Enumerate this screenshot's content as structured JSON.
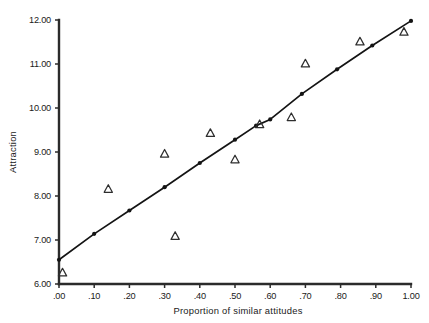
{
  "chart_data": {
    "type": "scatter",
    "title": "",
    "xlabel": "Proportion of similar attitudes",
    "ylabel": "Attraction",
    "xlim": [
      0.0,
      1.0
    ],
    "ylim": [
      6.0,
      12.0
    ],
    "grid": false,
    "legend": false,
    "xticks": [
      0.0,
      0.1,
      0.2,
      0.3,
      0.4,
      0.5,
      0.6,
      0.7,
      0.8,
      0.9,
      1.0
    ],
    "xticklabels": [
      ".00",
      ".10",
      ".20",
      ".30",
      ".40",
      ".50",
      ".60",
      ".70",
      ".80",
      ".90",
      "1.00"
    ],
    "yticks": [
      6.0,
      7.0,
      8.0,
      9.0,
      10.0,
      11.0,
      12.0
    ],
    "yticklabels": [
      "6.00",
      "7.00",
      "8.00",
      "9.00",
      "10.00",
      "11.00",
      "12.00"
    ],
    "series": [
      {
        "name": "predicted-line",
        "type": "line",
        "marker": "filled-circle",
        "x": [
          0.0,
          0.1,
          0.2,
          0.3,
          0.4,
          0.5,
          0.56,
          0.6,
          0.69,
          0.79,
          0.89,
          1.0
        ],
        "y": [
          6.55,
          7.14,
          7.67,
          8.2,
          8.75,
          9.28,
          9.6,
          9.74,
          10.32,
          10.88,
          11.42,
          11.98
        ]
      },
      {
        "name": "observed-points",
        "type": "scatter",
        "marker": "open-triangle",
        "x": [
          0.01,
          0.14,
          0.3,
          0.33,
          0.43,
          0.5,
          0.57,
          0.66,
          0.7,
          0.855,
          0.98
        ],
        "y": [
          6.25,
          8.15,
          8.95,
          7.08,
          9.42,
          8.82,
          9.62,
          9.78,
          11.0,
          11.5,
          11.72
        ]
      }
    ]
  },
  "figure": {
    "background_color": "#ffffff",
    "line_color": "#141414",
    "marker_color": "#2e2e2e",
    "axis_color": "#2b2b2b"
  }
}
